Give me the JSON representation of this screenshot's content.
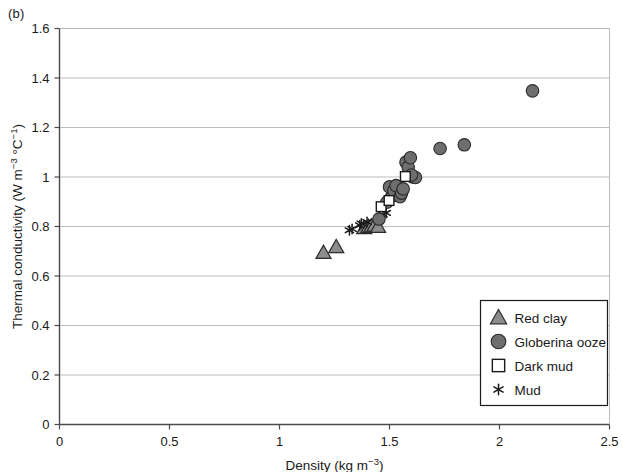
{
  "panel": {
    "label": "(b)"
  },
  "chart_data": {
    "type": "scatter",
    "title": "",
    "xlabel": "Density (kg m-3)",
    "xlabel_parts": {
      "base": "Density (kg m",
      "sup": "−3",
      "tail": ")"
    },
    "ylabel": "Thermal conductivity (W m-3 °C-1)",
    "ylabel_parts": {
      "base": "Thermal conductivity (W m",
      "sup1": "−3",
      "mid": " °C",
      "sup2": "−1",
      "tail": ")"
    },
    "xlim": [
      0,
      2.5
    ],
    "ylim": [
      0,
      1.6
    ],
    "xticks": [
      0,
      0.5,
      1,
      1.5,
      2,
      2.5
    ],
    "xticklabels": [
      "0",
      "0.5",
      "1",
      "1.5",
      "2",
      "2.5"
    ],
    "yticks": [
      0,
      0.2,
      0.4,
      0.6,
      0.8,
      1.0,
      1.2,
      1.4,
      1.6
    ],
    "yticklabels": [
      "0",
      "0.2",
      "0.4",
      "0.6",
      "0.8",
      "1",
      "1.2",
      "1.4",
      "1.6"
    ],
    "grid": {
      "horizontal": true,
      "vertical": false,
      "color": "#b5b5b5"
    },
    "legend": {
      "position": "lower right",
      "entries": [
        {
          "label": "Red clay",
          "marker": "triangle",
          "fill": "#8c8c8c",
          "stroke": "#2b2b2b"
        },
        {
          "label": "Globerina ooze",
          "marker": "circle",
          "fill": "#6e6e6e",
          "stroke": "#2b2b2b"
        },
        {
          "label": "Dark mud",
          "marker": "square",
          "fill": "#ffffff",
          "stroke": "#1a1a1a"
        },
        {
          "label": "Mud",
          "marker": "asterisk",
          "fill": "#1a1a1a",
          "stroke": "#1a1a1a"
        }
      ]
    },
    "series": [
      {
        "name": "Red clay",
        "marker": "triangle",
        "fill": "#8c8c8c",
        "stroke": "#2b2b2b",
        "points": [
          [
            1.2,
            0.695
          ],
          [
            1.258,
            0.718
          ],
          [
            1.385,
            0.795
          ],
          [
            1.405,
            0.8
          ],
          [
            1.418,
            0.802
          ],
          [
            1.432,
            0.805
          ],
          [
            1.448,
            0.8
          ],
          [
            1.5,
            0.925
          ],
          [
            1.512,
            0.938
          ]
        ]
      },
      {
        "name": "Globerina ooze",
        "marker": "circle",
        "fill": "#6e6e6e",
        "stroke": "#2b2b2b",
        "points": [
          [
            1.452,
            0.83
          ],
          [
            1.488,
            0.898
          ],
          [
            1.5,
            0.96
          ],
          [
            1.52,
            0.945
          ],
          [
            1.53,
            0.965
          ],
          [
            1.548,
            0.92
          ],
          [
            1.555,
            0.935
          ],
          [
            1.562,
            0.952
          ],
          [
            1.575,
            1.06
          ],
          [
            1.585,
            1.04
          ],
          [
            1.595,
            1.078
          ],
          [
            1.605,
            1.0
          ],
          [
            1.618,
            0.998
          ],
          [
            1.6,
            1.008
          ],
          [
            1.73,
            1.115
          ],
          [
            1.84,
            1.13
          ],
          [
            2.15,
            1.348
          ]
        ]
      },
      {
        "name": "Dark mud",
        "marker": "square",
        "fill": "#ffffff",
        "stroke": "#1a1a1a",
        "points": [
          [
            1.462,
            0.88
          ],
          [
            1.498,
            0.905
          ],
          [
            1.572,
            1.002
          ]
        ]
      },
      {
        "name": "Mud",
        "marker": "asterisk",
        "fill": "#1a1a1a",
        "stroke": "#1a1a1a",
        "points": [
          [
            1.318,
            0.785
          ],
          [
            1.33,
            0.79
          ],
          [
            1.365,
            0.805
          ],
          [
            1.372,
            0.812
          ],
          [
            1.398,
            0.818
          ],
          [
            1.47,
            0.848
          ],
          [
            1.485,
            0.855
          ]
        ]
      }
    ]
  }
}
